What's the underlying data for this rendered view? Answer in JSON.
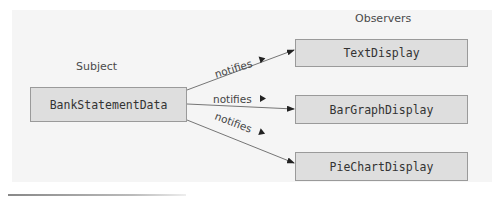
{
  "diagram": {
    "type": "observer-pattern",
    "subject": {
      "heading": "Subject",
      "name": "BankStatementData"
    },
    "observers": {
      "heading": "Observers",
      "items": [
        {
          "name": "TextDisplay"
        },
        {
          "name": "BarGraphDisplay"
        },
        {
          "name": "PieChartDisplay"
        }
      ]
    },
    "edges": [
      {
        "from": "BankStatementData",
        "to": "TextDisplay",
        "label": "notifies"
      },
      {
        "from": "BankStatementData",
        "to": "BarGraphDisplay",
        "label": "notifies"
      },
      {
        "from": "BankStatementData",
        "to": "PieChartDisplay",
        "label": "notifies"
      }
    ],
    "colors": {
      "box_fill": "#dedede",
      "box_border": "#9a9a9a",
      "panel": "#f5f5f5",
      "text": "#333333"
    }
  }
}
